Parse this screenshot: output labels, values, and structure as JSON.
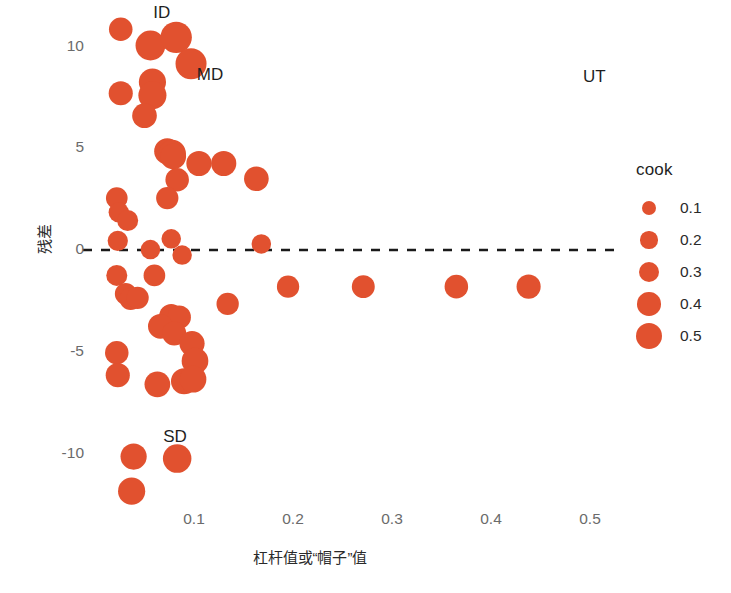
{
  "chart_data": {
    "type": "scatter",
    "title": "",
    "xlabel": "杠杆值或“帽子”值",
    "ylabel": "残差",
    "xlim": [
      0.0,
      0.545
    ],
    "ylim": [
      -13.2,
      12.2
    ],
    "xticks": [
      0.1,
      0.2,
      0.3,
      0.4,
      0.5
    ],
    "xtick_labels": [
      "0.1",
      "0.2",
      "0.3",
      "0.4",
      "0.5"
    ],
    "yticks": [
      10,
      5,
      0,
      -5,
      -10
    ],
    "ytick_labels": [
      "10",
      "5",
      "0",
      "-5",
      "-10"
    ],
    "grid": false,
    "point_color": "#e1512f",
    "reference_line": {
      "y": 0,
      "style": "dashed",
      "color": "#1a1a1a"
    },
    "size_encoding": "cook",
    "legend": {
      "title": "cook",
      "position": "right",
      "entries": [
        {
          "label": "0.1",
          "value": 0.1,
          "radius_px": 7.0
        },
        {
          "label": "0.2",
          "value": 0.2,
          "radius_px": 8.6
        },
        {
          "label": "0.3",
          "value": 0.3,
          "radius_px": 10.2
        },
        {
          "label": "0.4",
          "value": 0.4,
          "radius_px": 11.8
        },
        {
          "label": "0.5",
          "value": 0.5,
          "radius_px": 13.4
        }
      ]
    },
    "annotations": [
      {
        "text": "ID",
        "x": 0.073,
        "y": 11.6
      },
      {
        "text": "MD",
        "x": 0.117,
        "y": 8.55
      },
      {
        "text": "UT",
        "x": 0.507,
        "y": 8.45
      },
      {
        "text": "SD",
        "x": 0.083,
        "y": -9.25
      }
    ],
    "points": [
      {
        "x": 0.026,
        "y": 10.85,
        "cook": 0.13
      },
      {
        "x": 0.056,
        "y": 10.05,
        "cook": 0.26
      },
      {
        "x": 0.082,
        "y": 10.45,
        "cook": 0.3
      },
      {
        "x": 0.097,
        "y": 9.15,
        "cook": 0.29
      },
      {
        "x": 0.058,
        "y": 8.25,
        "cook": 0.2
      },
      {
        "x": 0.058,
        "y": 7.6,
        "cook": 0.22
      },
      {
        "x": 0.026,
        "y": 7.7,
        "cook": 0.14
      },
      {
        "x": 0.05,
        "y": 6.6,
        "cook": 0.15
      },
      {
        "x": 0.073,
        "y": 4.85,
        "cook": 0.18
      },
      {
        "x": 0.078,
        "y": 4.75,
        "cook": 0.2
      },
      {
        "x": 0.079,
        "y": 4.6,
        "cook": 0.17
      },
      {
        "x": 0.105,
        "y": 4.25,
        "cook": 0.16
      },
      {
        "x": 0.13,
        "y": 4.25,
        "cook": 0.16
      },
      {
        "x": 0.163,
        "y": 3.5,
        "cook": 0.15
      },
      {
        "x": 0.083,
        "y": 3.45,
        "cook": 0.13
      },
      {
        "x": 0.073,
        "y": 2.55,
        "cook": 0.11
      },
      {
        "x": 0.022,
        "y": 2.55,
        "cook": 0.1
      },
      {
        "x": 0.024,
        "y": 1.85,
        "cook": 0.08
      },
      {
        "x": 0.033,
        "y": 1.45,
        "cook": 0.09
      },
      {
        "x": 0.023,
        "y": 0.45,
        "cook": 0.08
      },
      {
        "x": 0.077,
        "y": 0.55,
        "cook": 0.07
      },
      {
        "x": 0.056,
        "y": 0.02,
        "cook": 0.07
      },
      {
        "x": 0.088,
        "y": -0.25,
        "cook": 0.07
      },
      {
        "x": 0.168,
        "y": 0.3,
        "cook": 0.07
      },
      {
        "x": 0.022,
        "y": -1.25,
        "cook": 0.09
      },
      {
        "x": 0.06,
        "y": -1.25,
        "cook": 0.1
      },
      {
        "x": 0.134,
        "y": -2.65,
        "cook": 0.11
      },
      {
        "x": 0.195,
        "y": -1.8,
        "cook": 0.11
      },
      {
        "x": 0.271,
        "y": -1.8,
        "cook": 0.12
      },
      {
        "x": 0.365,
        "y": -1.8,
        "cook": 0.13
      },
      {
        "x": 0.438,
        "y": -1.8,
        "cook": 0.14
      },
      {
        "x": 0.031,
        "y": -2.15,
        "cook": 0.1
      },
      {
        "x": 0.036,
        "y": -2.4,
        "cook": 0.11
      },
      {
        "x": 0.043,
        "y": -2.35,
        "cook": 0.11
      },
      {
        "x": 0.077,
        "y": -3.25,
        "cook": 0.14
      },
      {
        "x": 0.085,
        "y": -3.3,
        "cook": 0.13
      },
      {
        "x": 0.066,
        "y": -3.75,
        "cook": 0.15
      },
      {
        "x": 0.08,
        "y": -4.1,
        "cook": 0.14
      },
      {
        "x": 0.098,
        "y": -4.6,
        "cook": 0.16
      },
      {
        "x": 0.022,
        "y": -5.05,
        "cook": 0.13
      },
      {
        "x": 0.101,
        "y": -5.45,
        "cook": 0.19
      },
      {
        "x": 0.023,
        "y": -6.15,
        "cook": 0.14
      },
      {
        "x": 0.063,
        "y": -6.6,
        "cook": 0.17
      },
      {
        "x": 0.09,
        "y": -6.45,
        "cook": 0.18
      },
      {
        "x": 0.099,
        "y": -6.35,
        "cook": 0.19
      },
      {
        "x": 0.039,
        "y": -10.15,
        "cook": 0.18
      },
      {
        "x": 0.083,
        "y": -10.25,
        "cook": 0.23
      },
      {
        "x": 0.037,
        "y": -11.85,
        "cook": 0.2
      }
    ]
  }
}
